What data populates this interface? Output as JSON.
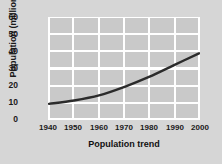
{
  "chart_data": {
    "type": "line",
    "title": "",
    "xlabel": "Population trend",
    "ylabel": "Population (millions)",
    "x": [
      1940,
      1950,
      1960,
      1970,
      1980,
      1990,
      2000
    ],
    "xticklabels": [
      "1940",
      "1950",
      "1960",
      "1970",
      "1980",
      "1990",
      "2000"
    ],
    "yticklabels": [
      "0",
      "10",
      "20",
      "30",
      "40",
      "50",
      "60"
    ],
    "yticks": [
      0,
      10,
      20,
      30,
      40,
      50,
      60
    ],
    "values": [
      9,
      11,
      14,
      19,
      25,
      32,
      39
    ],
    "xlim": [
      1940,
      2000
    ],
    "ylim": [
      0,
      60
    ],
    "grid": true,
    "legend": "none",
    "series": [
      {
        "name": "Population",
        "values": [
          9,
          11,
          14,
          19,
          25,
          32,
          39
        ]
      }
    ]
  },
  "style": {
    "figure_background": "#d6d6d6",
    "plot_background": "#c9c9c9",
    "grid_color": "#ffffff",
    "line_color": "#2b2b2b",
    "text_color": "#1a1a1a"
  }
}
